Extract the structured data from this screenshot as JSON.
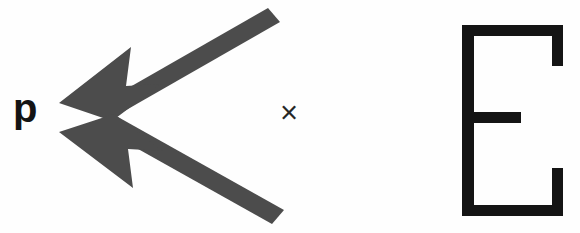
{
  "figure": {
    "background_color": "#fefefe",
    "width": 580,
    "height": 233
  },
  "labels": {
    "momentum_label": "p",
    "times_symbol": "×"
  },
  "glyph": {
    "letter": "E",
    "style": "outline-stroke",
    "color": "#141414"
  },
  "arrows": {
    "color": "#4c4c4c",
    "count": 2,
    "upper": {
      "name": "upper-arrow",
      "direction": "left-down-to-up-right",
      "tip_x": 60,
      "tip_y": 102,
      "tail_x": 274,
      "tail_y": 12
    },
    "lower": {
      "name": "lower-arrow",
      "direction": "left-up-to-down-right",
      "tip_x": 60,
      "tip_y": 134,
      "tail_x": 278,
      "tail_y": 220
    }
  },
  "colors": {
    "arrow_gray": "#4c4c4c",
    "ink_black": "#141414",
    "paper": "#fefefe"
  }
}
